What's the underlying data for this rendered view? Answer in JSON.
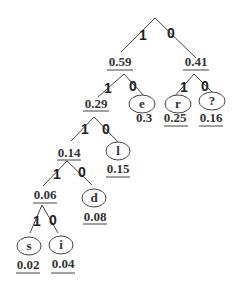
{
  "diagram": {
    "type": "huffman-tree",
    "edge_labels": {
      "left": "1",
      "right": "0"
    },
    "internal_nodes": [
      {
        "id": "n059",
        "value": "0.59"
      },
      {
        "id": "n041",
        "value": "0.41"
      },
      {
        "id": "n029",
        "value": "0.29"
      },
      {
        "id": "n014",
        "value": "0.14"
      },
      {
        "id": "n006",
        "value": "0.06"
      }
    ],
    "leaves": [
      {
        "id": "e",
        "symbol": "e",
        "value": "0.3"
      },
      {
        "id": "r",
        "symbol": "r",
        "value": "0.25"
      },
      {
        "id": "q",
        "symbol": "?",
        "value": "0.16"
      },
      {
        "id": "l",
        "symbol": "l",
        "value": "0.15"
      },
      {
        "id": "d",
        "symbol": "d",
        "value": "0.08"
      },
      {
        "id": "s",
        "symbol": "s",
        "value": "0.02"
      },
      {
        "id": "i",
        "symbol": "i",
        "value": "0.04"
      }
    ],
    "edges": [
      {
        "from": "root",
        "to": "n059",
        "bit": "1"
      },
      {
        "from": "root",
        "to": "n041",
        "bit": "0"
      },
      {
        "from": "n059",
        "to": "n029",
        "bit": "1"
      },
      {
        "from": "n059",
        "to": "e",
        "bit": "0"
      },
      {
        "from": "n041",
        "to": "r",
        "bit": "1"
      },
      {
        "from": "n041",
        "to": "q",
        "bit": "0"
      },
      {
        "from": "n029",
        "to": "n014",
        "bit": "1"
      },
      {
        "from": "n029",
        "to": "l",
        "bit": "0"
      },
      {
        "from": "n014",
        "to": "n006",
        "bit": "1"
      },
      {
        "from": "n014",
        "to": "d",
        "bit": "0"
      },
      {
        "from": "n006",
        "to": "s",
        "bit": "1"
      },
      {
        "from": "n006",
        "to": "i",
        "bit": "0"
      }
    ]
  }
}
